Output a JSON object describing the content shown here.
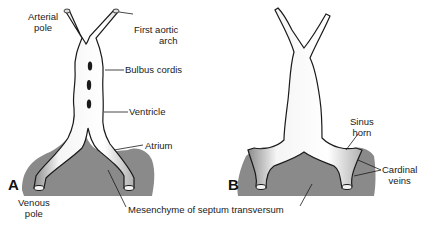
{
  "figure": {
    "panels": [
      {
        "id": "A",
        "label": "A"
      },
      {
        "id": "B",
        "label": "B"
      }
    ],
    "labels": {
      "arterial_pole_1": "Arterial",
      "arterial_pole_2": "pole",
      "first_aortic_arch_1": "First aortic",
      "first_aortic_arch_2": "arch",
      "bulbus_cordis": "Bulbus cordis",
      "ventricle": "Ventricle",
      "atrium": "Atrium",
      "venous_pole_1": "Venous",
      "venous_pole_2": "pole",
      "mesenchyme": "Mesenchyme of septum transversum",
      "sinus_horn_1": "Sinus",
      "sinus_horn_2": "horn",
      "cardinal_veins_1": "Cardinal",
      "cardinal_veins_2": "veins"
    },
    "colors": {
      "mesenchyme": "#8a8a8a",
      "heart_tube": "#f2f2f2",
      "outline": "#1a1a1a",
      "shading": "#9a9a9a"
    }
  }
}
